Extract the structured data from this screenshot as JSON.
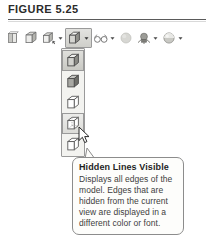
{
  "figure": {
    "caption": "FIGURE 5.25"
  },
  "toolbar": {
    "name": "visual-styles-toolbar",
    "items": [
      {
        "id": "2d-wireframe",
        "icon": "cube-2d-wireframe-icon",
        "label": "2D Wireframe",
        "has_caret": false
      },
      {
        "id": "3d-wireframe",
        "icon": "cube-3d-wireframe-icon",
        "label": "3D Wireframe",
        "has_caret": false
      },
      {
        "id": "3d-hidden",
        "icon": "cube-3d-hidden-icon",
        "label": "3D Hidden",
        "has_caret": true
      },
      {
        "id": "visual-style",
        "icon": "cube-shaded-icon",
        "label": "Visual Style",
        "has_caret": true,
        "state": "open"
      },
      {
        "id": "visual-style-manager",
        "icon": "glasses-icon",
        "label": "Visual Style Manager",
        "has_caret": true
      },
      {
        "id": "render",
        "icon": "sphere-plain-icon",
        "label": "Render",
        "has_caret": false
      },
      {
        "id": "lights",
        "icon": "lights-icon",
        "label": "Lights",
        "has_caret": true
      },
      {
        "id": "materials",
        "icon": "sphere-material-icon",
        "label": "Materials",
        "has_caret": true
      }
    ]
  },
  "dropdown": {
    "name": "visual-style-dropdown",
    "items": [
      {
        "id": "realistic",
        "icon": "cube-realistic-icon",
        "label": "Realistic",
        "state": "selected"
      },
      {
        "id": "conceptual",
        "icon": "cube-conceptual-icon",
        "label": "Conceptual",
        "state": "normal"
      },
      {
        "id": "3d-wireframe",
        "icon": "cube-wireframe-icon",
        "label": "3D Wireframe",
        "state": "normal"
      },
      {
        "id": "hidden-lines-visible",
        "icon": "cube-hidden-lines-icon",
        "label": "Hidden Lines Visible",
        "state": "hovered"
      },
      {
        "id": "hidden",
        "icon": "cube-hidden-icon",
        "label": "3D Hidden",
        "state": "normal"
      }
    ]
  },
  "tooltip": {
    "title": "Hidden Lines Visible",
    "body": "Displays all edges of the model. Edges that are hidden from the current view are displayed in a different color or font."
  },
  "colors": {
    "page_background": "#ffffff",
    "rule": "#5a5a5a",
    "button_border": "#9a9a9a",
    "tooltip_border": "#8c8c8c",
    "tooltip_background": "#fdfdfb",
    "text_primary": "#1f1f1f",
    "text_secondary": "#3d3d3d"
  }
}
